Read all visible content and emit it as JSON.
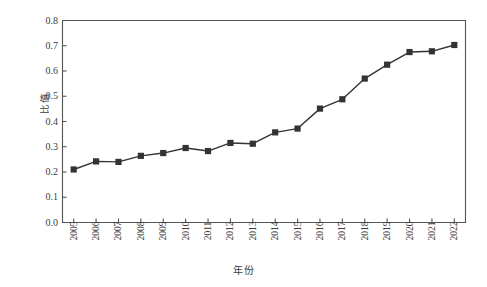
{
  "chart_data": {
    "type": "line",
    "title": "",
    "xlabel": "年份",
    "ylabel": "比值",
    "x": [
      2005,
      2006,
      2007,
      2008,
      2009,
      2010,
      2011,
      2012,
      2013,
      2014,
      2015,
      2016,
      2017,
      2018,
      2019,
      2020,
      2021,
      2022
    ],
    "categories": [
      "2005",
      "2006",
      "2007",
      "2008",
      "2009",
      "2010",
      "2011",
      "2012",
      "2013",
      "2014",
      "2015",
      "2016",
      "2017",
      "2018",
      "2019",
      "2020",
      "2021",
      "2022"
    ],
    "values": [
      0.21,
      0.242,
      0.24,
      0.264,
      0.275,
      0.295,
      0.283,
      0.315,
      0.312,
      0.357,
      0.372,
      0.451,
      0.488,
      0.57,
      0.625,
      0.675,
      0.678,
      0.703
    ],
    "ylim": [
      0.0,
      0.8
    ],
    "ytick_values": [
      0.0,
      0.1,
      0.2,
      0.3,
      0.4,
      0.5,
      0.6,
      0.7,
      0.8
    ],
    "ytick_labels": [
      "0.0",
      "0.1",
      "0.2",
      "0.3",
      "0.4",
      "0.5",
      "0.6",
      "0.7",
      "0.8"
    ],
    "grid": false,
    "legend": false,
    "legend_position": "none",
    "marker": "square",
    "series_color": "#333333",
    "line_color": "#333333",
    "axis_color": "#555555",
    "background_color": "#ffffff"
  }
}
